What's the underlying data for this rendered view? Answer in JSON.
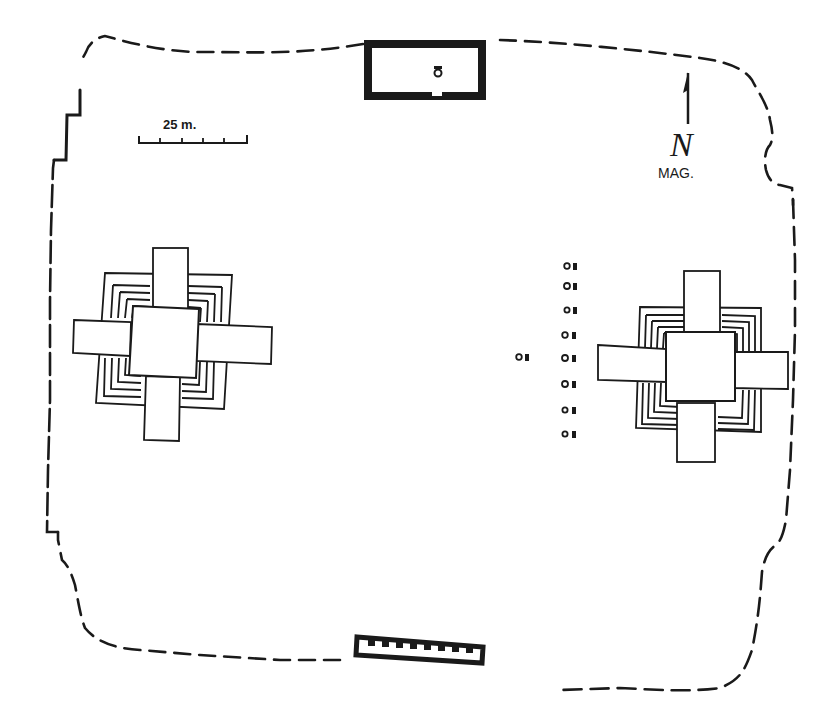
{
  "diagram": {
    "type": "archaeological-site-plan",
    "colors": {
      "ink": "#1a1a1a",
      "paper": "#ffffff"
    },
    "scale_bar": {
      "label": "25 m.",
      "ticks": 6
    },
    "north_arrow": {
      "letter": "N",
      "label": "MAG."
    },
    "structures": [
      {
        "id": "north-building",
        "description": "rectangular building with thick walls, small figure/altar inside, doorway on south wall"
      },
      {
        "id": "west-platform",
        "description": "radial pyramid platform with four stairways and stepped terraces"
      },
      {
        "id": "east-platform",
        "description": "radial pyramid platform with four stairways and stepped terraces"
      },
      {
        "id": "south-building",
        "description": "long rectangular colonnaded building with row of 8 pillars"
      },
      {
        "id": "stela-altar-row",
        "description": "row of 8 stela-and-altar pairs plus one outlier to the west",
        "count": 9
      }
    ],
    "boundary": {
      "style": "dashed",
      "description": "irregular enclosure wall outline"
    }
  }
}
